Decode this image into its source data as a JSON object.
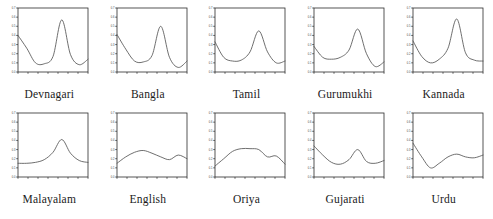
{
  "figure": {
    "title": "",
    "rows": 2,
    "columns": 5
  },
  "chart_data": [
    {
      "type": "line",
      "title": "Devnagari",
      "xlabel": "",
      "ylabel": "",
      "xlim": [
        0,
        7
      ],
      "ylim": [
        0.0,
        0.7
      ],
      "grid": false,
      "legend": "none",
      "x": [
        0,
        1,
        2,
        3,
        4,
        5,
        6,
        7
      ],
      "values": [
        0.4,
        0.26,
        0.1,
        0.09,
        0.17,
        0.57,
        0.19,
        0.08,
        0.14
      ]
    },
    {
      "type": "line",
      "title": "Bangla",
      "xlabel": "",
      "ylabel": "",
      "xlim": [
        0,
        7
      ],
      "ylim": [
        0.0,
        0.7
      ],
      "grid": false,
      "legend": "none",
      "x": [
        0,
        1,
        2,
        3,
        4,
        5,
        6,
        7
      ],
      "values": [
        0.41,
        0.25,
        0.12,
        0.11,
        0.18,
        0.5,
        0.16,
        0.05,
        0.12
      ]
    },
    {
      "type": "line",
      "title": "Tamil",
      "xlabel": "",
      "ylabel": "",
      "xlim": [
        0,
        7
      ],
      "ylim": [
        0.0,
        0.7
      ],
      "grid": false,
      "legend": "none",
      "x": [
        0,
        1,
        2,
        3,
        4,
        5,
        6,
        7
      ],
      "values": [
        0.33,
        0.16,
        0.12,
        0.13,
        0.22,
        0.45,
        0.22,
        0.1,
        0.12
      ]
    },
    {
      "type": "line",
      "title": "Gurumukhi",
      "xlabel": "",
      "ylabel": "",
      "xlim": [
        0,
        7
      ],
      "ylim": [
        0.0,
        0.7
      ],
      "grid": false,
      "legend": "none",
      "x": [
        0,
        1,
        2,
        3,
        4,
        5,
        6,
        7
      ],
      "values": [
        0.28,
        0.16,
        0.14,
        0.16,
        0.24,
        0.47,
        0.2,
        0.06,
        0.11
      ]
    },
    {
      "type": "line",
      "title": "Kannada",
      "xlabel": "",
      "ylabel": "",
      "xlim": [
        0,
        7
      ],
      "ylim": [
        0.0,
        0.7
      ],
      "grid": false,
      "legend": "none",
      "x": [
        0,
        1,
        2,
        3,
        4,
        5,
        6,
        7
      ],
      "values": [
        0.34,
        0.17,
        0.1,
        0.14,
        0.26,
        0.58,
        0.21,
        0.13,
        0.12
      ]
    },
    {
      "type": "line",
      "title": "Malayalam",
      "xlabel": "",
      "ylabel": "",
      "xlim": [
        0,
        7
      ],
      "ylim": [
        0.0,
        0.7
      ],
      "grid": false,
      "legend": "none",
      "x": [
        0,
        1,
        2,
        3,
        4,
        5,
        6,
        7
      ],
      "values": [
        0.15,
        0.15,
        0.16,
        0.19,
        0.27,
        0.41,
        0.26,
        0.18,
        0.16
      ]
    },
    {
      "type": "line",
      "title": "English",
      "xlabel": "",
      "ylabel": "",
      "xlim": [
        0,
        7
      ],
      "ylim": [
        0.0,
        0.7
      ],
      "grid": false,
      "legend": "none",
      "x": [
        0,
        1,
        2,
        3,
        4,
        5,
        6,
        7
      ],
      "values": [
        0.15,
        0.22,
        0.27,
        0.29,
        0.26,
        0.22,
        0.19,
        0.24,
        0.2
      ]
    },
    {
      "type": "line",
      "title": "Oriya",
      "xlabel": "",
      "ylabel": "",
      "xlim": [
        0,
        7
      ],
      "ylim": [
        0.0,
        0.7
      ],
      "grid": false,
      "legend": "none",
      "x": [
        0,
        1,
        2,
        3,
        4,
        5,
        6,
        7
      ],
      "values": [
        0.12,
        0.2,
        0.28,
        0.31,
        0.31,
        0.3,
        0.22,
        0.23,
        0.14
      ]
    },
    {
      "type": "line",
      "title": "Gujarati",
      "xlabel": "",
      "ylabel": "",
      "xlim": [
        0,
        7
      ],
      "ylim": [
        0.0,
        0.7
      ],
      "grid": false,
      "legend": "none",
      "x": [
        0,
        1,
        2,
        3,
        4,
        5,
        6,
        7
      ],
      "values": [
        0.34,
        0.24,
        0.16,
        0.14,
        0.19,
        0.3,
        0.17,
        0.15,
        0.18
      ]
    },
    {
      "type": "line",
      "title": "Urdu",
      "xlabel": "",
      "ylabel": "",
      "xlim": [
        0,
        7
      ],
      "ylim": [
        0.0,
        0.7
      ],
      "grid": false,
      "legend": "none",
      "x": [
        0,
        1,
        2,
        3,
        4,
        5,
        6,
        7
      ],
      "values": [
        0.37,
        0.22,
        0.1,
        0.15,
        0.22,
        0.25,
        0.22,
        0.21,
        0.24
      ]
    }
  ],
  "axes": {
    "y_ticks": [
      "0.0",
      "0.1",
      "0.2",
      "0.3",
      "0.4",
      "0.5",
      "0.6",
      "0.7"
    ],
    "x_tick_count": 8,
    "tick_color": "#2b2b2b",
    "line_color": "#555555"
  }
}
